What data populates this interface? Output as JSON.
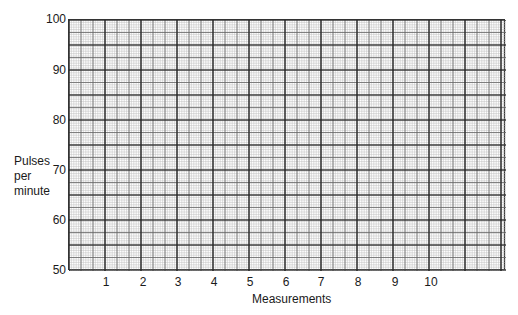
{
  "chart_data": {
    "type": "line",
    "title": "",
    "xlabel": "Measurements",
    "ylabel_lines": [
      "Pulses",
      "per",
      "minute"
    ],
    "ylabel": "Pulses per minute",
    "x_ticks": [
      "1",
      "2",
      "3",
      "4",
      "5",
      "6",
      "7",
      "8",
      "9",
      "10"
    ],
    "y_ticks": [
      "100",
      "90",
      "80",
      "70",
      "60",
      "50"
    ],
    "xlim": [
      0,
      12
    ],
    "ylim": [
      50,
      100
    ],
    "grid": true,
    "series": [],
    "note": "Blank graph-paper template; no data plotted"
  }
}
